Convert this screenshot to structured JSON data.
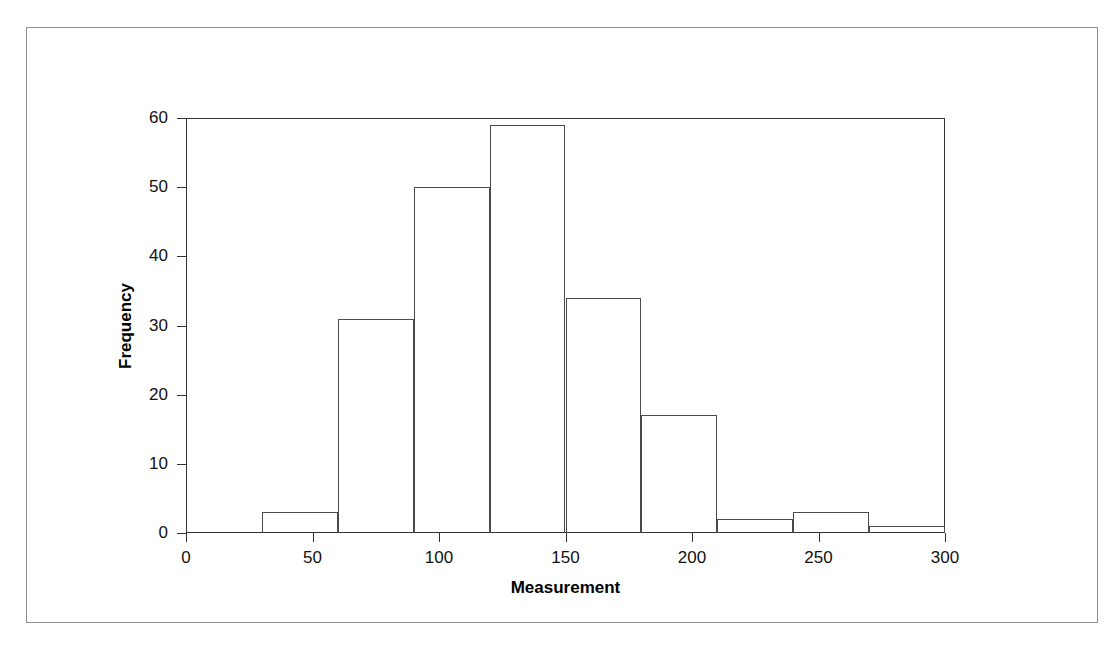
{
  "figure": {
    "background_color": "#ffffff",
    "line_color": "#333333",
    "border_color": "#8e8e8e"
  },
  "chart_data": {
    "type": "bar",
    "subtype": "histogram",
    "title": "",
    "subtitle": "",
    "xlabel": "Measurement",
    "ylabel": "Frequency",
    "xlim": [
      0,
      300
    ],
    "ylim": [
      0,
      60
    ],
    "grid": false,
    "legend": "none",
    "bin_width": 30,
    "bin_edges": [
      30,
      60,
      90,
      120,
      150,
      180,
      210,
      240,
      270,
      300
    ],
    "categories": [
      "30-60",
      "60-90",
      "90-120",
      "120-150",
      "150-180",
      "180-210",
      "210-240",
      "240-270",
      "270-300"
    ],
    "values": [
      3,
      31,
      50,
      59,
      34,
      17,
      2,
      3,
      1
    ],
    "xticks": [
      0,
      50,
      100,
      150,
      200,
      250,
      300
    ],
    "xtick_labels": [
      "0",
      "50",
      "100",
      "150",
      "200",
      "250",
      "300"
    ],
    "yticks": [
      0,
      10,
      20,
      30,
      40,
      50,
      60
    ],
    "ytick_labels": [
      "0",
      "10",
      "20",
      "30",
      "40",
      "50",
      "60"
    ],
    "bar_fill": "none",
    "bar_edge_color": "#4a4a4a"
  }
}
